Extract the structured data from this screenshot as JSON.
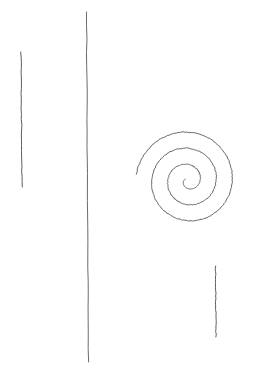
{
  "canvas": {
    "width": 263,
    "height": 374,
    "background_color": "#ffffff",
    "description": "Hand-drawn sketch: three thin vertical lines and one spiral"
  },
  "style": {
    "ink_color": "#5a5a5e",
    "ink_color_dark": "#3a3a3e",
    "line_width": 0.9,
    "spiral_line_width": 0.85
  },
  "shapes": [
    {
      "name": "left-vertical-line",
      "type": "line",
      "x1": 21.0,
      "y1": 52.0,
      "x2": 22.0,
      "y2": 187.0,
      "color": "#55555a",
      "width": 0.95
    },
    {
      "name": "center-vertical-line",
      "type": "line",
      "x1": 86.5,
      "y1": 12.0,
      "x2": 88.5,
      "y2": 362.0,
      "color": "#5a5a5f",
      "width": 0.9
    },
    {
      "name": "right-vertical-line",
      "type": "line",
      "x1": 215.5,
      "y1": 266.0,
      "x2": 216.0,
      "y2": 337.0,
      "color": "#55555a",
      "width": 0.95
    },
    {
      "name": "spiral",
      "type": "archimedean-spiral",
      "center_x": 188.0,
      "center_y": 180.5,
      "turns": 3.05,
      "inner_radius": 3.0,
      "outer_radius": 52.0,
      "start_angle_deg": 155,
      "direction": "counter-clockwise-outward",
      "color": "#4a4a4f",
      "width": 0.85
    }
  ],
  "chart_data": {
    "type": "scatter",
    "title": "",
    "xlabel": "",
    "ylabel": "",
    "xlim": [
      0,
      263
    ],
    "ylim": [
      0,
      374
    ],
    "grid": false,
    "legend": null,
    "annotations": [],
    "series": [
      {
        "name": "left-vertical-line",
        "x": [
          21.0,
          22.0
        ],
        "y": [
          52.0,
          187.0
        ]
      },
      {
        "name": "center-vertical-line",
        "x": [
          86.5,
          88.5
        ],
        "y": [
          12.0,
          362.0
        ]
      },
      {
        "name": "right-vertical-line",
        "x": [
          215.5,
          216.0
        ],
        "y": [
          266.0,
          337.0
        ]
      },
      {
        "name": "spiral-radius-crossings-horizontal",
        "x": [
          124,
          139,
          153,
          200,
          213,
          227,
          240
        ],
        "y": [
          180,
          180,
          180,
          180,
          180,
          180,
          180
        ]
      }
    ]
  }
}
